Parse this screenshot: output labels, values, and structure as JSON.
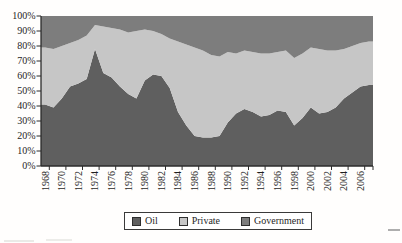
{
  "chart_data": {
    "type": "area",
    "stacked": true,
    "percent_stacked": true,
    "title": "",
    "xlabel": "",
    "ylabel": "",
    "ylim": [
      0,
      100
    ],
    "grid": false,
    "legend_position": "bottom",
    "x": [
      1968,
      1969,
      1970,
      1971,
      1972,
      1973,
      1974,
      1975,
      1976,
      1977,
      1978,
      1979,
      1980,
      1981,
      1982,
      1983,
      1984,
      1985,
      1986,
      1987,
      1988,
      1989,
      1990,
      1991,
      1992,
      1993,
      1994,
      1995,
      1996,
      1997,
      1998,
      1999,
      2000,
      2001,
      2002,
      2003,
      2004,
      2005,
      2006,
      2007
    ],
    "series": [
      {
        "name": "Oil",
        "color": "#5f5f5f",
        "values": [
          41,
          39,
          45,
          53,
          55,
          58,
          78,
          62,
          59,
          53,
          48,
          45,
          57,
          61,
          60,
          52,
          36,
          27,
          20,
          19,
          19,
          20,
          29,
          35,
          38,
          36,
          33,
          34,
          37,
          36,
          27,
          32,
          39,
          35,
          36,
          39,
          45,
          49,
          53,
          54
        ]
      },
      {
        "name": "Private",
        "color": "#c6c6c6",
        "values": [
          38,
          39,
          35,
          29,
          29,
          29,
          16,
          31,
          33,
          38,
          41,
          45,
          34,
          29,
          28,
          33,
          47,
          54,
          59,
          58,
          55,
          53,
          47,
          40,
          39,
          40,
          42,
          41,
          39,
          41,
          45,
          43,
          40,
          43,
          41,
          38,
          33,
          31,
          29,
          29
        ]
      },
      {
        "name": "Government",
        "color": "#7d7d7d",
        "values": [
          21,
          22,
          20,
          18,
          16,
          13,
          6,
          7,
          8,
          9,
          11,
          10,
          9,
          10,
          12,
          15,
          17,
          19,
          21,
          23,
          26,
          27,
          24,
          25,
          23,
          24,
          25,
          25,
          24,
          23,
          28,
          25,
          21,
          22,
          23,
          23,
          22,
          20,
          18,
          17
        ]
      }
    ],
    "ytick_labels": [
      "100%",
      "90%",
      "80%",
      "70%",
      "60%",
      "50%",
      "40%",
      "30%",
      "20%",
      "10%",
      "0%"
    ],
    "xtick_labels": [
      "1968",
      "1970",
      "1972",
      "1974",
      "1976",
      "1978",
      "1980",
      "1982",
      "1984",
      "1986",
      "1988",
      "1990",
      "1992",
      "1994",
      "1996",
      "1998",
      "2000",
      "2002",
      "2004",
      "2006"
    ]
  },
  "legend": {
    "items": [
      {
        "label": "Oil"
      },
      {
        "label": "Private"
      },
      {
        "label": "Government"
      }
    ]
  }
}
